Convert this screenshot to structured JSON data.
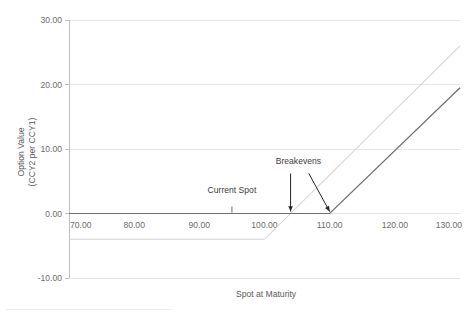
{
  "chart_data": {
    "type": "line",
    "title": "",
    "xlabel": "Spot at Maturity",
    "ylabel": "Option Value\n(CCY2 per CCY1)",
    "ylabel_line1": "Option Value",
    "ylabel_line2": "(CCY2 per CCY1)",
    "xlim": [
      70,
      130
    ],
    "ylim": [
      -10,
      30
    ],
    "xticks": [
      70,
      80,
      90,
      100,
      110,
      120,
      130
    ],
    "yticks": [
      -10,
      0,
      10,
      20,
      30
    ],
    "xtick_labels": [
      "70.00",
      "80.00",
      "90.00",
      "100.00",
      "110.00",
      "120.00",
      "130.00"
    ],
    "ytick_labels": [
      "-10.00",
      "0.00",
      "10.00",
      "20.00",
      "30.00"
    ],
    "grid": true,
    "grid_axis": "y",
    "legend": "none",
    "series": [
      {
        "name": "Option payoff net of premium",
        "color": "#d4d4d4",
        "style": "light",
        "x": [
          70,
          100,
          130
        ],
        "values": [
          -4.0,
          -4.0,
          26.0
        ]
      },
      {
        "name": "Option payoff at maturity",
        "color": "#6e6e6e",
        "style": "dark",
        "x": [
          70,
          110,
          130
        ],
        "values": [
          0.0,
          0.0,
          19.5
        ]
      }
    ],
    "annotations": [
      {
        "label": "Current Spot",
        "x": 95,
        "y": 0,
        "marker": "tick",
        "label_x": 95,
        "label_y": 3.2
      },
      {
        "label": "Breakevens",
        "label_x": 105.2,
        "label_y": 7.6,
        "arrows": [
          {
            "from_x": 104.0,
            "from_y": 6.2,
            "to_x": 104.0,
            "to_y": 0.3
          },
          {
            "from_x": 106.8,
            "from_y": 6.2,
            "to_x": 110.0,
            "to_y": 0.3
          }
        ]
      }
    ]
  },
  "colors": {
    "gridline": "#e6e6e6",
    "axis": "#bfbfbf",
    "tick_text": "#6b6b6b",
    "annotation_text": "#404040",
    "series_light": "#d4d4d4",
    "series_dark": "#6e6e6e",
    "arrow": "#262626",
    "background": "#ffffff"
  }
}
